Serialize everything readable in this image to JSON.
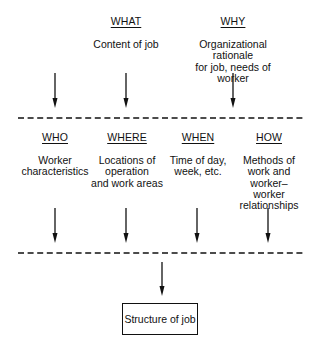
{
  "diagram": {
    "title": "",
    "top_row": [
      {
        "id": "what",
        "heading": "WHAT",
        "description": "Content of job"
      },
      {
        "id": "why",
        "heading": "WHY",
        "description": "Organizational rationale\nfor job, needs of worker"
      }
    ],
    "middle_row": [
      {
        "id": "who",
        "heading": "WHO",
        "description": "Worker\ncharacteristics"
      },
      {
        "id": "where",
        "heading": "WHERE",
        "description": "Locations of\noperation\nand work areas"
      },
      {
        "id": "when",
        "heading": "WHEN",
        "description": "Time of day,\nweek, etc."
      },
      {
        "id": "how",
        "heading": "HOW",
        "description": "Methods of\nwork and\nworker–worker\nrelationships"
      }
    ],
    "output": {
      "label": "Structure of job"
    },
    "connectors": {
      "top_arrows_into_first_dashed_line": 3,
      "middle_arrows_into_second_dashed_line": 4,
      "dashed_lines": 2,
      "final_arrow_to_output": 1
    },
    "colors": {
      "line": "#111111",
      "background": "#ffffff"
    }
  }
}
